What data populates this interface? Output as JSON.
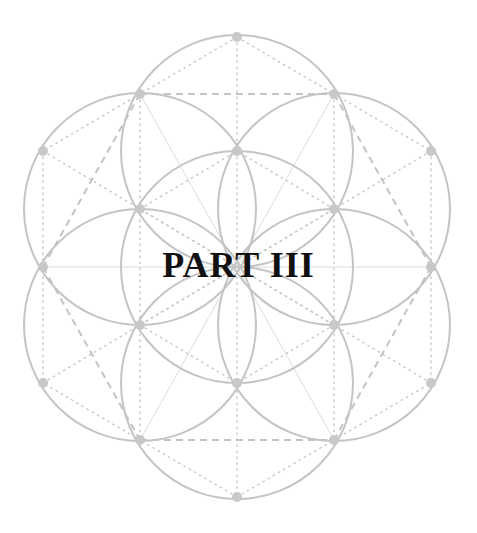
{
  "title": "PART III",
  "diagram": {
    "type": "seed-of-life",
    "center": [
      237,
      267
    ],
    "radius": 116,
    "colors": {
      "stroke": "#c4c4c4",
      "node": "#c8c8c8",
      "text": "#111111",
      "background": "#ffffff"
    },
    "circle_centers": [
      [
        237,
        267
      ],
      [
        237,
        151
      ],
      [
        237,
        383
      ],
      [
        140,
        209
      ],
      [
        334,
        209
      ],
      [
        140,
        325
      ],
      [
        334,
        325
      ]
    ],
    "nodes": [
      [
        237,
        37
      ],
      [
        140,
        94
      ],
      [
        334,
        94
      ],
      [
        43,
        151
      ],
      [
        237,
        151
      ],
      [
        431,
        151
      ],
      [
        140,
        209
      ],
      [
        334,
        209
      ],
      [
        43,
        267
      ],
      [
        431,
        267
      ],
      [
        140,
        325
      ],
      [
        334,
        325
      ],
      [
        43,
        383
      ],
      [
        237,
        383
      ],
      [
        431,
        383
      ],
      [
        140,
        440
      ],
      [
        334,
        440
      ],
      [
        237,
        497
      ]
    ]
  }
}
